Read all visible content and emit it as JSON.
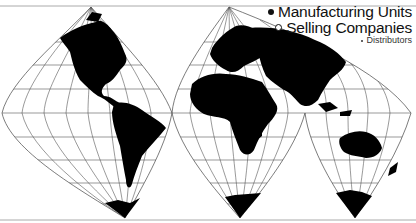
{
  "map": {
    "projection": "interrupted-lobe-world-map",
    "colors": {
      "land": "#000000",
      "graticule": "#555555",
      "background": "#ffffff",
      "border": "#999999"
    },
    "lobes": [
      {
        "name": "Americas",
        "top_apex": [
          91,
          7
        ],
        "bottom_apex": [
          125,
          218
        ]
      },
      {
        "name": "Europe-Africa",
        "top_apex": [
          229,
          7
        ],
        "bottom_apex": [
          240,
          218
        ]
      },
      {
        "name": "Asia-Oceania",
        "bottom_apex": [
          355,
          218
        ]
      }
    ]
  },
  "legend": {
    "items": [
      {
        "icon": "filled-circle-icon",
        "label": "Manufacturing Units"
      },
      {
        "icon": "open-circle-icon",
        "label": "Selling Companies"
      },
      {
        "icon": "small-dot-icon",
        "label": "Distributors"
      }
    ]
  }
}
